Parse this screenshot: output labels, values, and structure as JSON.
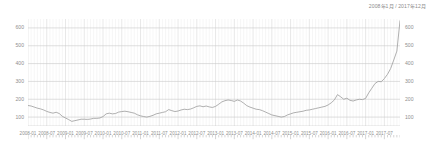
{
  "chart": {
    "title": "2008年1月 / 2017年12月"
  },
  "chart_data": {
    "type": "line",
    "title": "2008年1月 / 2017年12月",
    "xlabel": "",
    "ylabel": "",
    "grid": true,
    "legend": false,
    "line_color": "#a0a0a0",
    "ylim": [
      50,
      650
    ],
    "y_ticks": [
      100,
      200,
      300,
      400,
      500,
      600
    ],
    "y_ticks_right": [
      100,
      200,
      300,
      400,
      500,
      600
    ],
    "x_tick_labels": [
      "2008-01",
      "2008-07",
      "2009-01",
      "2009-07",
      "2010-01",
      "2010-07",
      "2011-01",
      "2011-07",
      "2012-01",
      "2012-07",
      "2013-01",
      "2013-07",
      "2014-01",
      "2014-07",
      "2015-01",
      "2015-07",
      "2016-01",
      "2016-07",
      "2017-01",
      "2017-07"
    ],
    "x_start": "2008-01",
    "x_end": "2017-12",
    "x_frequency": "monthly",
    "series": [
      {
        "name": "value",
        "x": [
          "2008-01",
          "2008-02",
          "2008-03",
          "2008-04",
          "2008-05",
          "2008-06",
          "2008-07",
          "2008-08",
          "2008-09",
          "2008-10",
          "2008-11",
          "2008-12",
          "2009-01",
          "2009-02",
          "2009-03",
          "2009-04",
          "2009-05",
          "2009-06",
          "2009-07",
          "2009-08",
          "2009-09",
          "2009-10",
          "2009-11",
          "2009-12",
          "2010-01",
          "2010-02",
          "2010-03",
          "2010-04",
          "2010-05",
          "2010-06",
          "2010-07",
          "2010-08",
          "2010-09",
          "2010-10",
          "2010-11",
          "2010-12",
          "2011-01",
          "2011-02",
          "2011-03",
          "2011-04",
          "2011-05",
          "2011-06",
          "2011-07",
          "2011-08",
          "2011-09",
          "2011-10",
          "2011-11",
          "2011-12",
          "2012-01",
          "2012-02",
          "2012-03",
          "2012-04",
          "2012-05",
          "2012-06",
          "2012-07",
          "2012-08",
          "2012-09",
          "2012-10",
          "2012-11",
          "2012-12",
          "2013-01",
          "2013-02",
          "2013-03",
          "2013-04",
          "2013-05",
          "2013-06",
          "2013-07",
          "2013-08",
          "2013-09",
          "2013-10",
          "2013-11",
          "2013-12",
          "2014-01",
          "2014-02",
          "2014-03",
          "2014-04",
          "2014-05",
          "2014-06",
          "2014-07",
          "2014-08",
          "2014-09",
          "2014-10",
          "2014-11",
          "2014-12",
          "2015-01",
          "2015-02",
          "2015-03",
          "2015-04",
          "2015-05",
          "2015-06",
          "2015-07",
          "2015-08",
          "2015-09",
          "2015-10",
          "2015-11",
          "2015-12",
          "2016-01",
          "2016-02",
          "2016-03",
          "2016-04",
          "2016-05",
          "2016-06",
          "2016-07",
          "2016-08",
          "2016-09",
          "2016-10",
          "2016-11",
          "2016-12",
          "2017-01",
          "2017-02",
          "2017-03",
          "2017-04",
          "2017-05",
          "2017-06",
          "2017-07",
          "2017-08",
          "2017-09",
          "2017-10",
          "2017-11",
          "2017-12"
        ],
        "values": [
          165,
          162,
          156,
          150,
          146,
          140,
          132,
          126,
          122,
          127,
          120,
          104,
          95,
          86,
          76,
          80,
          84,
          88,
          88,
          87,
          89,
          93,
          93,
          95,
          103,
          118,
          122,
          118,
          120,
          128,
          131,
          133,
          130,
          126,
          122,
          113,
          107,
          103,
          100,
          104,
          110,
          118,
          122,
          126,
          130,
          142,
          136,
          131,
          134,
          140,
          144,
          142,
          145,
          152,
          160,
          163,
          158,
          162,
          157,
          154,
          160,
          172,
          185,
          192,
          196,
          193,
          188,
          196,
          190,
          178,
          164,
          156,
          150,
          144,
          142,
          136,
          128,
          120,
          112,
          108,
          104,
          100,
          103,
          112,
          118,
          124,
          127,
          130,
          133,
          138,
          140,
          144,
          148,
          152,
          156,
          160,
          168,
          180,
          196,
          226,
          214,
          200,
          206,
          194,
          190,
          196,
          200,
          198,
          205,
          236,
          262,
          288,
          300,
          298,
          316,
          340,
          372,
          420,
          470,
          640
        ]
      }
    ]
  }
}
